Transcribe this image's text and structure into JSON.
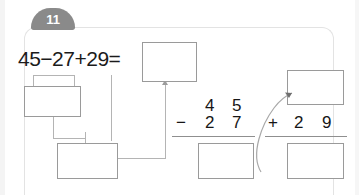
{
  "badge": {
    "number": "11"
  },
  "equation": {
    "text": "45−27+29="
  },
  "boxes": {
    "result": "",
    "sub_step1": "",
    "sub_step2": "",
    "difference": "",
    "carry": "",
    "sum": ""
  },
  "vertical_subtraction": {
    "operator": "−",
    "minuend_tens": "4",
    "minuend_ones": "5",
    "subtrahend_tens": "2",
    "subtrahend_ones": "7"
  },
  "vertical_addition": {
    "operator": "+",
    "addend_tens": "2",
    "addend_ones": "9"
  },
  "colors": {
    "badge_fill": "#8a8a8a",
    "badge_text": "#ffffff",
    "box_border": "#9a9a9a",
    "connector": "#b4b4b4",
    "card_border": "#e3e3e3",
    "digit_text": "#161616"
  }
}
